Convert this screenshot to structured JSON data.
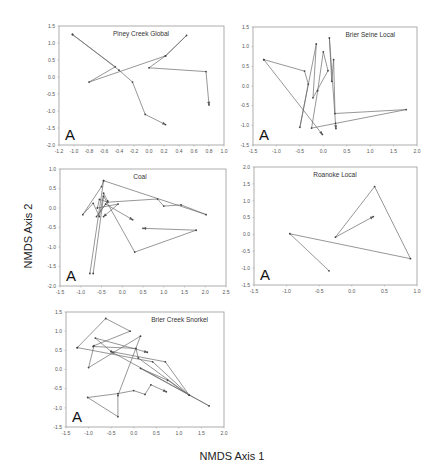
{
  "figure": {
    "x_axis_label": "NMDS Axis 1",
    "y_axis_label": "NMDS Axis 2",
    "panel_letter": "A"
  },
  "chart_data": [
    {
      "type": "line",
      "title": "Piney Creek Global",
      "panel_letter": "A",
      "xlabel": "NMDS Axis 1",
      "ylabel": "NMDS Axis 2",
      "xlim": [
        -1.2,
        1.0
      ],
      "ylim": [
        -2.0,
        1.5
      ],
      "xticks": [
        "-1.2",
        "-1.0",
        "-0.8",
        "-0.6",
        "-0.4",
        "-0.2",
        "0.0",
        "0.2",
        "0.4",
        "0.6",
        "0.8",
        "1.0"
      ],
      "yticks": [
        "1.5",
        "1.0",
        "0.5",
        "0.0",
        "-0.5",
        "-1.0",
        "-1.5",
        "-2.0"
      ],
      "grid": false,
      "series": [
        {
          "name": "trajectory",
          "points": [
            [
              -1.02,
              1.25
            ],
            [
              -0.45,
              0.3
            ],
            [
              -0.8,
              -0.15
            ],
            [
              0.22,
              0.62
            ],
            [
              0.5,
              1.22
            ],
            [
              0.22,
              0.62
            ],
            [
              0.0,
              0.27
            ],
            [
              0.76,
              0.16
            ],
            [
              0.8,
              -0.82
            ]
          ]
        },
        {
          "name": "trajectory-2",
          "points": [
            [
              -1.02,
              1.25
            ],
            [
              -0.4,
              0.2
            ],
            [
              -0.22,
              -0.15
            ],
            [
              -0.05,
              -1.1
            ],
            [
              0.22,
              -1.4
            ]
          ]
        }
      ]
    },
    {
      "type": "line",
      "title": "Brier Seine Local",
      "panel_letter": "A",
      "xlabel": "NMDS Axis 1",
      "ylabel": "NMDS Axis 2",
      "xlim": [
        -1.5,
        2.0
      ],
      "ylim": [
        -1.5,
        1.5
      ],
      "xticks": [
        "-1.5",
        "-1.0",
        "-0.5",
        "0.0",
        "0.5",
        "1.0",
        "1.5",
        "2.0"
      ],
      "yticks": [
        "1.5",
        "1.0",
        "0.5",
        "0.0",
        "-0.5",
        "-1.0",
        "-1.5"
      ],
      "grid": false,
      "series": [
        {
          "name": "trajectory",
          "points": [
            [
              -1.27,
              0.67
            ],
            [
              -0.4,
              0.38
            ],
            [
              -0.32,
              0.05
            ],
            [
              -0.5,
              -1.05
            ],
            [
              -0.15,
              1.07
            ],
            [
              -0.22,
              -0.3
            ],
            [
              0.1,
              0.39
            ],
            [
              0.0,
              0.87
            ],
            [
              -0.12,
              -0.12
            ],
            [
              -0.25,
              -1.07
            ],
            [
              1.77,
              -0.6
            ],
            [
              0.25,
              -0.7
            ],
            [
              0.22,
              0.67
            ],
            [
              0.18,
              0.12
            ],
            [
              0.13,
              1.22
            ],
            [
              0.26,
              -0.95
            ],
            [
              0.27,
              -1.08
            ]
          ]
        },
        {
          "name": "trajectory-2",
          "points": [
            [
              -1.27,
              0.67
            ],
            [
              -0.02,
              -1.23
            ]
          ]
        }
      ]
    },
    {
      "type": "line",
      "title": "Coal",
      "panel_letter": "A",
      "xlabel": "NMDS Axis 1",
      "ylabel": "NMDS Axis 2",
      "xlim": [
        -1.5,
        2.5
      ],
      "ylim": [
        -2.0,
        1.0
      ],
      "xticks": [
        "-1.5",
        "-1.0",
        "-0.5",
        "0.0",
        "0.5",
        "1.0",
        "1.5",
        "2.0",
        "2.5"
      ],
      "yticks": [
        "1.0",
        "0.5",
        "0.0",
        "-0.5",
        "-1.0",
        "-1.5",
        "-2.0"
      ],
      "grid": false,
      "series": [
        {
          "name": "trajectory",
          "points": [
            [
              -0.78,
              -1.68
            ],
            [
              -0.45,
              0.7
            ],
            [
              -0.5,
              0.55
            ],
            [
              -0.95,
              -0.17
            ],
            [
              -0.7,
              0.12
            ],
            [
              -0.55,
              -0.22
            ],
            [
              -0.45,
              0.38
            ],
            [
              -0.35,
              0.18
            ],
            [
              -0.62,
              -0.22
            ],
            [
              -0.4,
              0.1
            ],
            [
              0.25,
              -0.3
            ]
          ]
        },
        {
          "name": "trajectory-2",
          "points": [
            [
              -0.45,
              0.7
            ],
            [
              2.02,
              -0.17
            ],
            [
              1.42,
              0.08
            ],
            [
              1.0,
              0.05
            ],
            [
              0.85,
              0.23
            ],
            [
              -0.35,
              0.15
            ],
            [
              -0.55,
              0.22
            ],
            [
              -0.6,
              0.0
            ],
            [
              -0.1,
              0.1
            ],
            [
              -0.45,
              -0.22
            ]
          ]
        },
        {
          "name": "trajectory-3",
          "points": [
            [
              -0.7,
              -1.68
            ],
            [
              -0.45,
              0.3
            ],
            [
              0.3,
              -1.13
            ],
            [
              1.78,
              -0.57
            ],
            [
              0.5,
              -0.52
            ]
          ]
        }
      ]
    },
    {
      "type": "line",
      "title": "Roanoke Local",
      "panel_letter": "A",
      "xlabel": "NMDS Axis 1",
      "ylabel": "NMDS Axis 2",
      "xlim": [
        -1.5,
        1.0
      ],
      "ylim": [
        -1.5,
        2.0
      ],
      "xticks": [
        "-1.5",
        "-1.0",
        "-0.5",
        "0.0",
        "0.5",
        "1.0"
      ],
      "yticks": [
        "2.0",
        "1.5",
        "1.0",
        "0.5",
        "0.0",
        "-0.5",
        "-1.0",
        "-1.5"
      ],
      "grid": false,
      "series": [
        {
          "name": "trajectory",
          "points": [
            [
              -0.35,
              -1.08
            ],
            [
              -0.95,
              0.02
            ],
            [
              0.9,
              -0.72
            ],
            [
              0.35,
              1.42
            ],
            [
              -0.25,
              -0.08
            ],
            [
              0.33,
              0.53
            ]
          ]
        }
      ]
    },
    {
      "type": "line",
      "title": "Brier Creek Snorkel",
      "panel_letter": "A",
      "xlabel": "NMDS Axis 1",
      "ylabel": "NMDS Axis 2",
      "xlim": [
        -1.5,
        2.0
      ],
      "ylim": [
        -1.5,
        1.5
      ],
      "xticks": [
        "-1.5",
        "-1.0",
        "-0.5",
        "0.0",
        "0.5",
        "1.0",
        "1.5",
        "2.0"
      ],
      "yticks": [
        "1.5",
        "1.0",
        "0.5",
        "0.0",
        "-0.5",
        "-1.0",
        "-1.5"
      ],
      "grid": false,
      "series": [
        {
          "name": "trajectory",
          "points": [
            [
              -1.25,
              0.57
            ],
            [
              -0.62,
              1.33
            ],
            [
              -0.08,
              1.0
            ],
            [
              -0.88,
              0.62
            ],
            [
              -1.0,
              0.05
            ],
            [
              0.15,
              0.87
            ],
            [
              -0.35,
              -0.68
            ],
            [
              -0.35,
              -1.23
            ],
            [
              -1.02,
              -0.73
            ],
            [
              -0.35,
              -0.63
            ],
            [
              0.0,
              -0.55
            ],
            [
              0.25,
              -0.65
            ],
            [
              0.38,
              -0.4
            ],
            [
              0.72,
              -0.58
            ]
          ]
        },
        {
          "name": "trajectory-2",
          "points": [
            [
              -1.25,
              0.57
            ],
            [
              0.42,
              0.2
            ],
            [
              1.23,
              -0.67
            ],
            [
              0.7,
              0.2
            ],
            [
              -0.5,
              0.47
            ],
            [
              -0.85,
              0.82
            ],
            [
              0.3,
              0.45
            ]
          ]
        },
        {
          "name": "trajectory-3",
          "points": [
            [
              -0.9,
              0.6
            ],
            [
              0.05,
              0.55
            ],
            [
              0.1,
              0.3
            ],
            [
              1.23,
              -0.67
            ],
            [
              0.75,
              -0.28
            ],
            [
              0.15,
              0.03
            ],
            [
              1.67,
              -0.95
            ],
            [
              -0.5,
              0.47
            ]
          ]
        }
      ]
    }
  ]
}
